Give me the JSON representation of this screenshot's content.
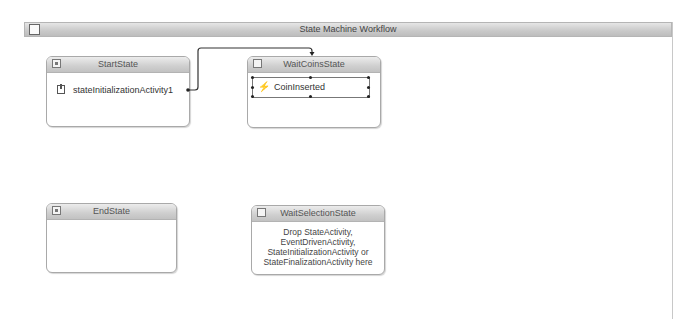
{
  "workflow": {
    "title": "State Machine Workflow"
  },
  "states": {
    "start": {
      "title": "StartState",
      "activity": "stateInitializationActivity1",
      "icon": "initial-state-icon"
    },
    "waitCoins": {
      "title": "WaitCoinsState",
      "activity": "CoinInserted",
      "icon": "state-icon"
    },
    "end": {
      "title": "EndState",
      "icon": "completed-state-icon"
    },
    "waitSelection": {
      "title": "WaitSelectionState",
      "icon": "state-icon",
      "hint_lines": [
        "Drop StateActivity,",
        "EventDrivenActivity,",
        "StateInitializationActivity or",
        "StateFinalizationActivity here"
      ]
    }
  },
  "connections": [
    {
      "from": "stateInitializationActivity1",
      "to": "WaitCoinsState"
    }
  ]
}
